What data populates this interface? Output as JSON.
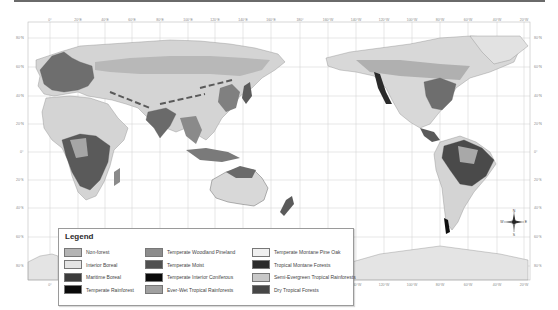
{
  "map": {
    "top_axis_labels": [
      {
        "x": 50,
        "label": "0°"
      },
      {
        "x": 78,
        "label": "20°E"
      },
      {
        "x": 105,
        "label": "40°E"
      },
      {
        "x": 132,
        "label": "60°E"
      },
      {
        "x": 160,
        "label": "80°E"
      },
      {
        "x": 188,
        "label": "100°E"
      },
      {
        "x": 215,
        "label": "120°E"
      },
      {
        "x": 243,
        "label": "140°E"
      },
      {
        "x": 271,
        "label": "160°E"
      },
      {
        "x": 300,
        "label": "180°"
      },
      {
        "x": 328,
        "label": "160°W"
      },
      {
        "x": 356,
        "label": "140°W"
      },
      {
        "x": 384,
        "label": "120°W"
      },
      {
        "x": 412,
        "label": "100°W"
      },
      {
        "x": 440,
        "label": "80°W"
      },
      {
        "x": 468,
        "label": "60°W"
      },
      {
        "x": 497,
        "label": "40°W"
      },
      {
        "x": 524,
        "label": "20°W"
      }
    ],
    "left_lat_labels": [
      {
        "y": 38,
        "label": "80°N"
      },
      {
        "y": 67,
        "label": "60°N"
      },
      {
        "y": 96,
        "label": "40°N"
      },
      {
        "y": 124,
        "label": "20°N"
      },
      {
        "y": 152,
        "label": "0°"
      },
      {
        "y": 180,
        "label": "20°S"
      },
      {
        "y": 208,
        "label": "40°S"
      },
      {
        "y": 237,
        "label": "60°S"
      },
      {
        "y": 266,
        "label": "80°S"
      }
    ],
    "right_lat_labels": [
      {
        "y": 38,
        "label": "80°N"
      },
      {
        "y": 67,
        "label": "60°N"
      },
      {
        "y": 96,
        "label": "40°N"
      },
      {
        "y": 124,
        "label": "20°N"
      },
      {
        "y": 152,
        "label": "0°"
      },
      {
        "y": 180,
        "label": "20°S"
      },
      {
        "y": 208,
        "label": "40°S"
      },
      {
        "y": 237,
        "label": "60°S"
      },
      {
        "y": 266,
        "label": "80°S"
      }
    ],
    "bottom_axis_labels": [
      {
        "x": 50,
        "label": "0°"
      },
      {
        "x": 356,
        "label": "140°W"
      },
      {
        "x": 384,
        "label": "120°W"
      },
      {
        "x": 412,
        "label": "100°W"
      },
      {
        "x": 440,
        "label": "80°W"
      },
      {
        "x": 468,
        "label": "60°W"
      },
      {
        "x": 497,
        "label": "40°W"
      },
      {
        "x": 524,
        "label": "20°W"
      }
    ],
    "compass": {
      "n": "N",
      "s": "S",
      "e": "E",
      "w": "W"
    }
  },
  "legend": {
    "title": "Legend",
    "columns": [
      [
        {
          "label": "Non-forest",
          "color": "#b4b4b4"
        },
        {
          "label": "Interior Boreal",
          "color": "#e4e4e4"
        },
        {
          "label": "Maritime Boreal",
          "color": "#3c3c3c"
        },
        {
          "label": "Temperate Rainforest",
          "color": "#0a0a0a"
        }
      ],
      [
        {
          "label": "Temperate Woodland Pineland",
          "color": "#8c8c8c"
        },
        {
          "label": "Temperate Moist",
          "color": "#505050"
        },
        {
          "label": "Temperate Interior Coniferous",
          "color": "#0a0a0a"
        },
        {
          "label": "Ever-Wet Tropical Rainforests",
          "color": "#a0a0a0"
        }
      ],
      [
        {
          "label": "Temperate Montane Pine Oak",
          "color": "#f0f0f0"
        },
        {
          "label": "Tropical Montane Forests",
          "color": "#2a2a2a"
        },
        {
          "label": "Semi-Evergreen Tropical Rainforests",
          "color": "#c8c8c8"
        },
        {
          "label": "Dry Tropical Forests",
          "color": "#464646"
        }
      ]
    ]
  }
}
